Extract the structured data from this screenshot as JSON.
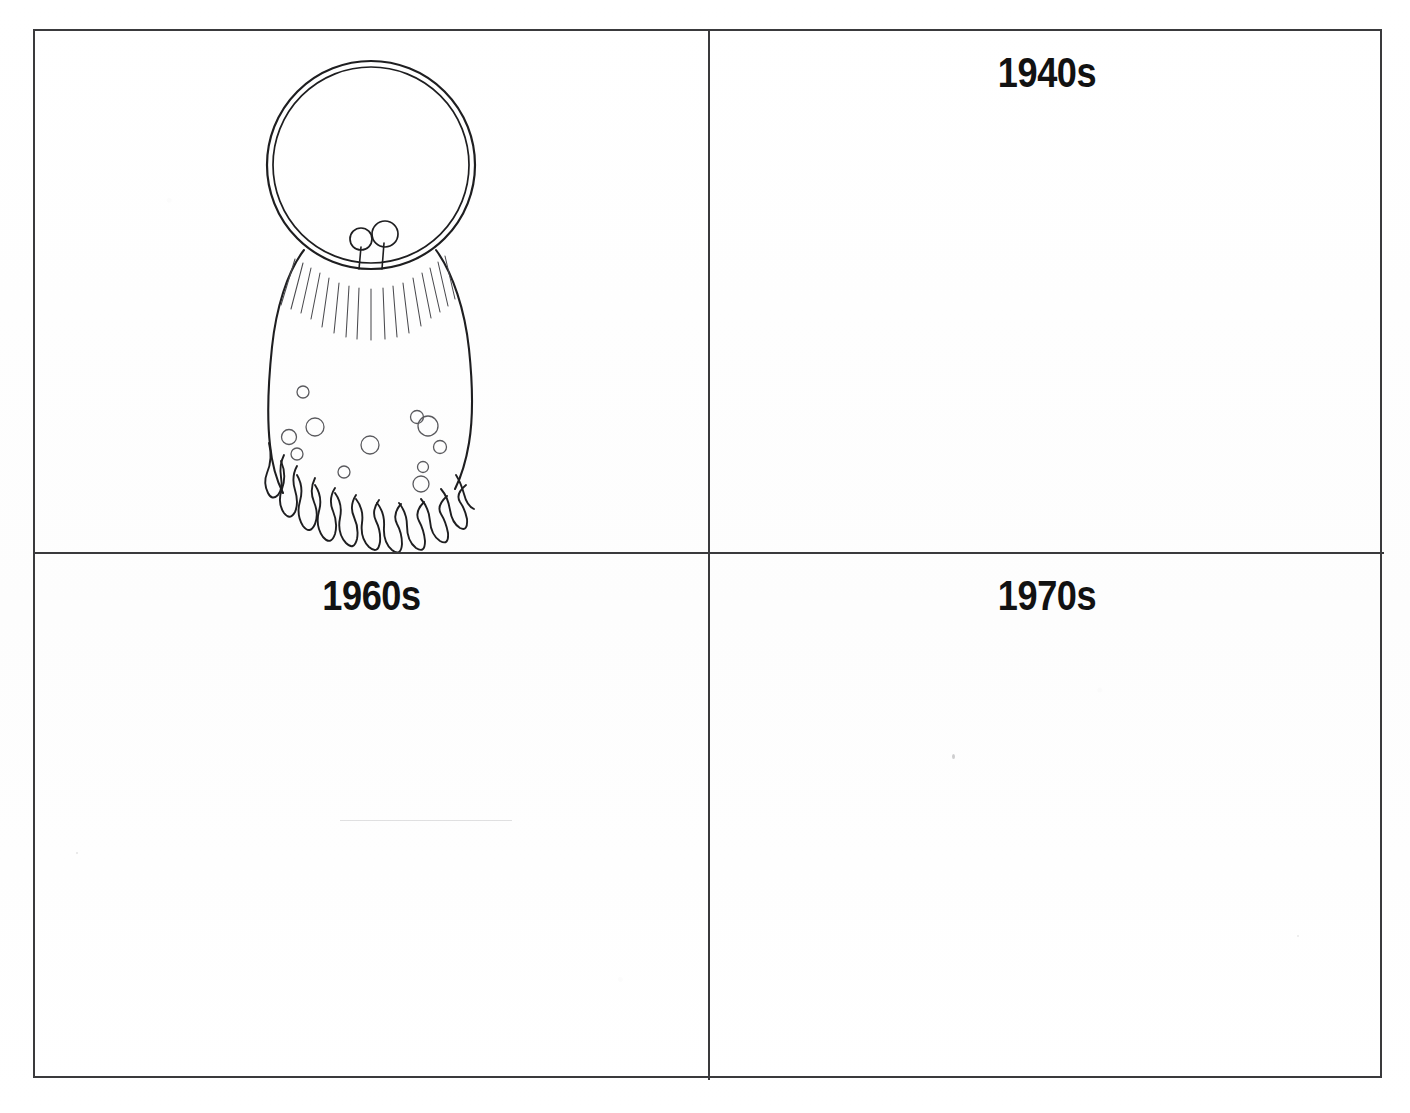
{
  "document": {
    "title": "Decades Worksheet",
    "background_color": "#fefefe",
    "ink_color": "#1e1e20",
    "border_color": "#3a3a3c"
  },
  "grid": {
    "rows": 2,
    "columns": 2,
    "panels": [
      {
        "id": "panel-drawing",
        "position": "top-left",
        "label": "",
        "has_label": false,
        "content_type": "drawing",
        "drawing": {
          "name": "dome-creature-sketch",
          "description": "Hand-drawn creature: a large double-outlined dome or bubble helmet over a rounded body with radiating hair strokes, two small eyestalk circles, scattered small bubbles, and a squiggly fringe along the bottom edge.",
          "stroke_color": "#1e1e20"
        }
      },
      {
        "id": "panel-1940s",
        "position": "top-right",
        "label": "1940s",
        "has_label": true,
        "content_type": "empty"
      },
      {
        "id": "panel-1960s",
        "position": "bottom-left",
        "label": "1960s",
        "has_label": true,
        "content_type": "empty"
      },
      {
        "id": "panel-1970s",
        "position": "bottom-right",
        "label": "1970s",
        "has_label": true,
        "content_type": "empty"
      }
    ]
  }
}
